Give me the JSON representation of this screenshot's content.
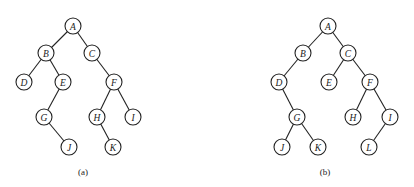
{
  "figure": {
    "node_radius": 8,
    "trees": [
      {
        "id": "a",
        "caption": "(a)",
        "caption_pos": [
          83,
          172
        ],
        "nodes": [
          {
            "label": "A",
            "x": 73,
            "y": 26
          },
          {
            "label": "B",
            "x": 46,
            "y": 53
          },
          {
            "label": "C",
            "x": 92,
            "y": 53
          },
          {
            "label": "D",
            "x": 24,
            "y": 82
          },
          {
            "label": "E",
            "x": 63,
            "y": 82
          },
          {
            "label": "F",
            "x": 114,
            "y": 82
          },
          {
            "label": "G",
            "x": 44,
            "y": 117
          },
          {
            "label": "H",
            "x": 97,
            "y": 117
          },
          {
            "label": "I",
            "x": 133,
            "y": 117
          },
          {
            "label": "J",
            "x": 69,
            "y": 147
          },
          {
            "label": "K",
            "x": 113,
            "y": 147
          }
        ],
        "edges": [
          [
            "A",
            "B"
          ],
          [
            "A",
            "C"
          ],
          [
            "B",
            "D"
          ],
          [
            "B",
            "E"
          ],
          [
            "E",
            "G"
          ],
          [
            "G",
            "J"
          ],
          [
            "C",
            "F"
          ],
          [
            "F",
            "H"
          ],
          [
            "F",
            "I"
          ],
          [
            "H",
            "K"
          ]
        ]
      },
      {
        "id": "b",
        "caption": "(b)",
        "caption_pos": [
          325,
          172
        ],
        "nodes": [
          {
            "label": "A",
            "x": 328,
            "y": 26
          },
          {
            "label": "B",
            "x": 303,
            "y": 53
          },
          {
            "label": "C",
            "x": 348,
            "y": 53
          },
          {
            "label": "D",
            "x": 279,
            "y": 82
          },
          {
            "label": "E",
            "x": 329,
            "y": 82
          },
          {
            "label": "F",
            "x": 370,
            "y": 82
          },
          {
            "label": "G",
            "x": 297,
            "y": 117
          },
          {
            "label": "H",
            "x": 353,
            "y": 117
          },
          {
            "label": "I",
            "x": 390,
            "y": 117
          },
          {
            "label": "J",
            "x": 282,
            "y": 147
          },
          {
            "label": "K",
            "x": 318,
            "y": 147
          },
          {
            "label": "L",
            "x": 369,
            "y": 147
          }
        ],
        "edges": [
          [
            "A",
            "B"
          ],
          [
            "A",
            "C"
          ],
          [
            "B",
            "D"
          ],
          [
            "D",
            "G"
          ],
          [
            "G",
            "J"
          ],
          [
            "G",
            "K"
          ],
          [
            "C",
            "E"
          ],
          [
            "C",
            "F"
          ],
          [
            "F",
            "H"
          ],
          [
            "F",
            "I"
          ],
          [
            "I",
            "L"
          ]
        ]
      }
    ]
  }
}
